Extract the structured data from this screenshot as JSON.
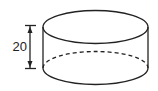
{
  "diagram": {
    "shape": "cylinder",
    "dimension_label": "20",
    "dimension_meaning": "height",
    "stroke_color": "#222222",
    "background": "#ffffff"
  }
}
